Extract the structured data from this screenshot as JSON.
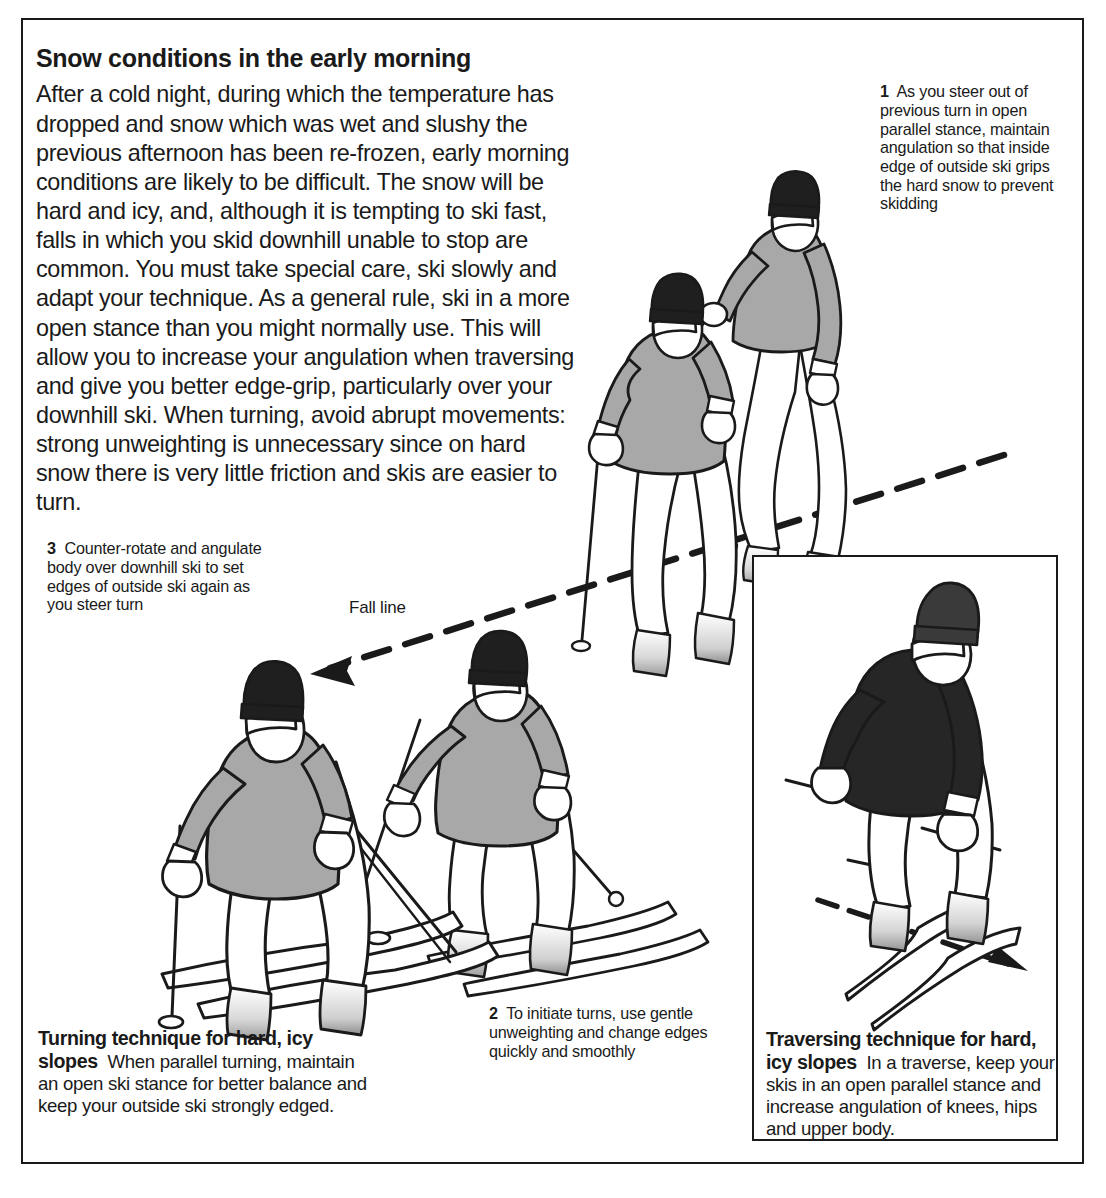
{
  "page": {
    "headline": "Snow conditions in the early morning",
    "body": "After a cold night, during which the temperature has dropped and snow which was wet and slushy the previous afternoon has been re-frozen, early morning conditions are likely to be difficult. The snow will be hard and icy, and, although it is tempting to ski fast, falls in which you skid downhill unable to stop are common. You must take special care, ski slowly and adapt your technique. As a general rule, ski in a more open stance than you might normally use. This will allow you to increase your angulation when traversing and give you better edge-grip, particularly over your downhill ski. When turning, avoid abrupt movements: strong unweighting is unnecessary since on hard snow there is very little friction and skis are easier to turn."
  },
  "steps": [
    {
      "number": "1",
      "text": "As you steer out of previous turn in open parallel stance, maintain angulation so that inside edge of outside ski grips the hard snow to prevent skidding"
    },
    {
      "number": "2",
      "text": "To initiate turns, use gentle unweighting and change edges quickly and smoothly"
    },
    {
      "number": "3",
      "text": "Counter-rotate and angulate body over downhill ski to set edges of outside ski again as you steer turn"
    }
  ],
  "labels": {
    "fall_line": "Fall line"
  },
  "captions": {
    "turning": {
      "title": "Turning technique for hard, icy slopes",
      "text": "When parallel turning, maintain an open ski stance for better balance and keep your outside ski strongly edged."
    },
    "traversing": {
      "title": "Traversing technique for hard, icy slopes",
      "text": "In a traverse, keep your skis in an open parallel stance and increase angulation of knees, hips and upper body."
    }
  },
  "figures": {
    "sequence": [
      {
        "name": "skier-step-1",
        "sweater": "gray",
        "pose": "steering out of previous turn, open parallel stance"
      },
      {
        "name": "skier-step-2a",
        "sweater": "gray",
        "pose": "unweighting, changing edges"
      },
      {
        "name": "skier-step-2b",
        "sweater": "gray",
        "pose": "initiating turn"
      },
      {
        "name": "skier-step-3",
        "sweater": "gray",
        "pose": "counter-rotated, angulated over downhill ski"
      }
    ],
    "inset": {
      "name": "skier-traversing",
      "sweater": "black",
      "pose": "traversing with angulation"
    }
  },
  "colors": {
    "ink": "#1a1a1a",
    "sweater_gray": "#a8a8a8",
    "sweater_black": "#262626",
    "hat_black": "#1f1f1f",
    "boot_gray": "#8e8e8e",
    "paper": "#ffffff"
  }
}
